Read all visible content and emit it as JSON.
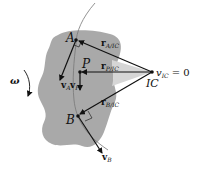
{
  "diagram": {
    "points": {
      "A": "A",
      "P": "P",
      "B": "B",
      "IC": "IC"
    },
    "position_vectors": {
      "rA": {
        "main": "r",
        "sub": "A/IC"
      },
      "rP": {
        "main": "r",
        "sub": "P/IC"
      },
      "rB": {
        "main": "r",
        "sub": "B/IC"
      }
    },
    "velocity_vectors": {
      "vA": {
        "main": "v",
        "sub": "A"
      },
      "vP": {
        "main": "v",
        "sub": "P"
      },
      "vB": {
        "main": "v",
        "sub": "B"
      }
    },
    "ic_equation": {
      "v": "v",
      "sub": "IC",
      "rest": " = 0"
    },
    "omega": "ω",
    "colors": {
      "body": "#a9a9a9",
      "triangle": "#d3d3d3",
      "line": "#111111",
      "arc": "#777777"
    }
  }
}
